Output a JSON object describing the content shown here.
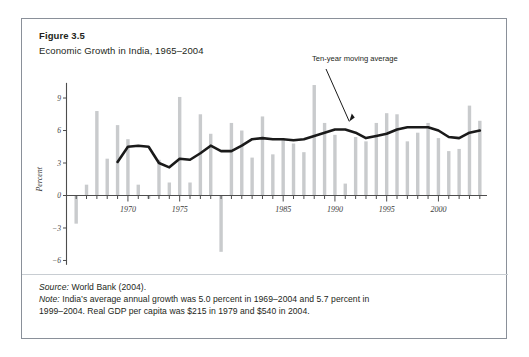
{
  "figure": {
    "number": "Figure 3.5",
    "caption": "Economic Growth in India, 1965–2004"
  },
  "footer": {
    "source_keyword": "Source:",
    "source_text": " World Bank (2004).",
    "note_keyword": "Note:",
    "note_text_line1": " India’s average annual growth was 5.0 percent in 1969–2004 and 5.7 percent in",
    "note_text_line2": "1999–2004. Real GDP per capita was $215 in 1979 and $540 in 2004."
  },
  "colors": {
    "bar": "#c9cbcd",
    "line": "#1a1a1a",
    "axis": "#4d4d4d",
    "frame": "#8a9099",
    "text": "#231f20"
  },
  "chart_data": {
    "type": "bar",
    "title": "Economic Growth in India, 1965–2004",
    "xlabel": "",
    "ylabel": "Percent",
    "ylim": [
      -6.6,
      10.6
    ],
    "yticks": [
      9,
      6,
      3,
      0,
      -3,
      -6
    ],
    "ytick_labels": [
      "9",
      "6",
      "3",
      "0",
      "−3",
      "−6"
    ],
    "xticks": [
      1970,
      1975,
      1985,
      1990,
      1995,
      2000
    ],
    "xtick_labels": [
      "1970",
      "1975",
      "1985",
      "1990",
      "1995",
      "2000"
    ],
    "grid": false,
    "legend": "none",
    "categories": [
      1965,
      1966,
      1967,
      1968,
      1969,
      1970,
      1971,
      1972,
      1973,
      1974,
      1975,
      1976,
      1977,
      1978,
      1979,
      1980,
      1981,
      1982,
      1983,
      1984,
      1985,
      1986,
      1987,
      1988,
      1989,
      1990,
      1991,
      1992,
      1993,
      1994,
      1995,
      1996,
      1997,
      1998,
      1999,
      2000,
      2001,
      2002,
      2003,
      2004
    ],
    "series": [
      {
        "name": "Annual GDP growth",
        "type": "bar",
        "values": [
          -2.6,
          1.0,
          7.8,
          3.4,
          6.5,
          5.2,
          1.0,
          -0.3,
          3.3,
          1.2,
          9.1,
          1.2,
          7.5,
          5.7,
          -5.2,
          6.7,
          6.0,
          3.5,
          7.3,
          3.8,
          5.3,
          4.8,
          4.0,
          10.2,
          6.7,
          5.6,
          1.1,
          5.4,
          5.0,
          6.7,
          7.6,
          7.5,
          5.0,
          5.8,
          6.7,
          5.3,
          4.1,
          4.3,
          8.3,
          6.9
        ]
      },
      {
        "name": "Ten-year moving average",
        "type": "line",
        "values": [
          null,
          null,
          null,
          null,
          3.1,
          4.5,
          4.6,
          4.5,
          3.0,
          2.6,
          3.4,
          3.3,
          3.9,
          4.6,
          4.1,
          4.1,
          4.6,
          5.2,
          5.3,
          5.2,
          5.2,
          5.1,
          5.2,
          5.5,
          5.8,
          6.1,
          6.1,
          5.8,
          5.3,
          5.5,
          5.7,
          6.1,
          6.3,
          6.3,
          6.3,
          6.0,
          5.4,
          5.3,
          5.8,
          6.0
        ]
      }
    ],
    "annotations": [
      {
        "label": "Ten-year moving average",
        "points_to_year": 1991
      }
    ]
  }
}
